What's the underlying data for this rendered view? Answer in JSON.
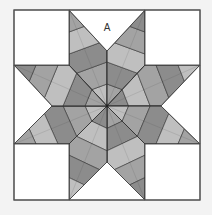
{
  "diagram": {
    "title_label": "A",
    "label_position": [
      107,
      31
    ],
    "colors": {
      "background": "#f3f3f3",
      "block_fill": "#ffffff",
      "outline": "#555555",
      "seam": "#333333",
      "shade_light": "#bfbfbf",
      "shade_mid": "#a3a3a3",
      "shade_dark": "#8c8c8c"
    },
    "frame": {
      "x": 14,
      "y": 10,
      "width": 186,
      "height": 190
    },
    "center": [
      107,
      106
    ],
    "corner_squares": [
      {
        "name": "top-left",
        "x": 14,
        "y": 10,
        "width": 55,
        "height": 55
      },
      {
        "name": "top-right",
        "x": 145,
        "y": 10,
        "width": 55,
        "height": 55
      },
      {
        "name": "bottom-left",
        "x": 14,
        "y": 144,
        "width": 55,
        "height": 56
      },
      {
        "name": "bottom-right",
        "x": 145,
        "y": 144,
        "width": 55,
        "height": 56
      }
    ],
    "side_triangles": [
      {
        "name": "top",
        "points": [
          [
            69,
            10
          ],
          [
            145,
            10
          ],
          [
            107,
            51
          ]
        ]
      },
      {
        "name": "right",
        "points": [
          [
            200,
            65
          ],
          [
            200,
            144
          ],
          [
            161,
            106
          ]
        ]
      },
      {
        "name": "bottom",
        "points": [
          [
            69,
            200
          ],
          [
            145,
            200
          ],
          [
            107,
            162
          ]
        ]
      },
      {
        "name": "left",
        "points": [
          [
            14,
            65
          ],
          [
            14,
            144
          ],
          [
            52,
            106
          ]
        ]
      }
    ],
    "star_points": [
      {
        "name": "top-left",
        "tip": [
          69,
          10
        ],
        "side_a": [
          69,
          65
        ],
        "side_b": [
          107,
          51
        ],
        "stripes": 5,
        "start_shade": 0
      },
      {
        "name": "top-right",
        "tip": [
          145,
          10
        ],
        "side_a": [
          107,
          51
        ],
        "side_b": [
          145,
          65
        ],
        "stripes": 5,
        "start_shade": 1
      },
      {
        "name": "right-top",
        "tip": [
          200,
          65
        ],
        "side_a": [
          145,
          65
        ],
        "side_b": [
          161,
          106
        ],
        "stripes": 5,
        "start_shade": 2
      },
      {
        "name": "right-bottom",
        "tip": [
          200,
          144
        ],
        "side_a": [
          161,
          106
        ],
        "side_b": [
          145,
          144
        ],
        "stripes": 5,
        "start_shade": 0
      },
      {
        "name": "bottom-right",
        "tip": [
          145,
          200
        ],
        "side_a": [
          145,
          144
        ],
        "side_b": [
          107,
          162
        ],
        "stripes": 5,
        "start_shade": 1
      },
      {
        "name": "bottom-left",
        "tip": [
          69,
          200
        ],
        "side_a": [
          107,
          162
        ],
        "side_b": [
          69,
          144
        ],
        "stripes": 5,
        "start_shade": 2
      },
      {
        "name": "left-bottom",
        "tip": [
          14,
          144
        ],
        "side_a": [
          69,
          144
        ],
        "side_b": [
          52,
          106
        ],
        "stripes": 5,
        "start_shade": 0
      },
      {
        "name": "left-top",
        "tip": [
          14,
          65
        ],
        "side_a": [
          52,
          106
        ],
        "side_b": [
          69,
          65
        ],
        "stripes": 5,
        "start_shade": 1
      }
    ]
  }
}
